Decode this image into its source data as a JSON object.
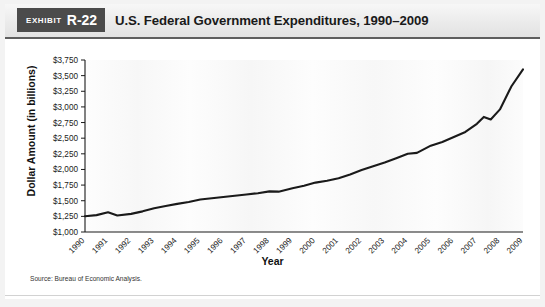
{
  "exhibit": {
    "word": "Exhibit",
    "number": "R-22"
  },
  "title": "U.S. Federal Government Expenditures, 1990–2009",
  "source": "Source: Bureau of Economic Analysis.",
  "axis": {
    "ylabel": "Dollar Amount (in billions)",
    "xlabel": "Year"
  },
  "chart_data": {
    "type": "line",
    "title": "U.S. Federal Government Expenditures, 1990–2009",
    "xlabel": "Year",
    "ylabel": "Dollar Amount (in billions)",
    "categories": [
      "1990",
      "1991",
      "1992",
      "1993",
      "1994",
      "1995",
      "1996",
      "1997",
      "1998",
      "1999",
      "2000",
      "2001",
      "2002",
      "2003",
      "2004",
      "2005",
      "2006",
      "2007",
      "2008",
      "2009"
    ],
    "values": [
      1253,
      1315,
      1280,
      1380,
      1450,
      1520,
      1560,
      1600,
      1650,
      1700,
      1790,
      1860,
      1990,
      2110,
      2250,
      2380,
      2520,
      2730,
      2960,
      3600
    ],
    "tick_labels_y": [
      "$1,000",
      "$1,250",
      "$1,500",
      "$1,750",
      "$2,000",
      "$2,250",
      "$2,500",
      "$2,750",
      "$3,000",
      "$3,250",
      "$3,500",
      "$3,750"
    ],
    "ylim": [
      1000,
      3750
    ],
    "ytick_step": 250,
    "grid": false,
    "legend": false,
    "legend_position": "none",
    "series_color": "#1a1a1a",
    "annotations": [],
    "detail_points": [
      {
        "x": 1990.0,
        "y": 1253
      },
      {
        "x": 1990.5,
        "y": 1270
      },
      {
        "x": 1991.0,
        "y": 1315
      },
      {
        "x": 1991.4,
        "y": 1265
      },
      {
        "x": 1992.0,
        "y": 1290
      },
      {
        "x": 1992.5,
        "y": 1330
      },
      {
        "x": 1993.0,
        "y": 1380
      },
      {
        "x": 1993.5,
        "y": 1415
      },
      {
        "x": 1994.0,
        "y": 1450
      },
      {
        "x": 1994.5,
        "y": 1480
      },
      {
        "x": 1995.0,
        "y": 1520
      },
      {
        "x": 1995.5,
        "y": 1540
      },
      {
        "x": 1996.0,
        "y": 1560
      },
      {
        "x": 1996.5,
        "y": 1580
      },
      {
        "x": 1997.0,
        "y": 1600
      },
      {
        "x": 1997.5,
        "y": 1620
      },
      {
        "x": 1998.0,
        "y": 1650
      },
      {
        "x": 1998.4,
        "y": 1645
      },
      {
        "x": 1999.0,
        "y": 1700
      },
      {
        "x": 1999.5,
        "y": 1740
      },
      {
        "x": 2000.0,
        "y": 1790
      },
      {
        "x": 2000.5,
        "y": 1820
      },
      {
        "x": 2001.0,
        "y": 1860
      },
      {
        "x": 2001.5,
        "y": 1920
      },
      {
        "x": 2002.0,
        "y": 1990
      },
      {
        "x": 2002.5,
        "y": 2050
      },
      {
        "x": 2003.0,
        "y": 2110
      },
      {
        "x": 2003.5,
        "y": 2180
      },
      {
        "x": 2004.0,
        "y": 2250
      },
      {
        "x": 2004.4,
        "y": 2265
      },
      {
        "x": 2005.0,
        "y": 2380
      },
      {
        "x": 2005.5,
        "y": 2440
      },
      {
        "x": 2006.0,
        "y": 2520
      },
      {
        "x": 2006.5,
        "y": 2600
      },
      {
        "x": 2007.0,
        "y": 2730
      },
      {
        "x": 2007.3,
        "y": 2840
      },
      {
        "x": 2007.6,
        "y": 2800
      },
      {
        "x": 2008.0,
        "y": 2960
      },
      {
        "x": 2008.5,
        "y": 3330
      },
      {
        "x": 2009.0,
        "y": 3600
      }
    ]
  },
  "geometry": {
    "plot_left": 85,
    "plot_right": 523,
    "plot_top": 21,
    "plot_bottom": 193
  }
}
